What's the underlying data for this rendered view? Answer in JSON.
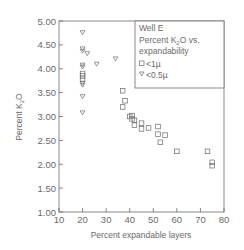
{
  "chart_data": {
    "type": "scatter",
    "title": "Well E",
    "subtitle": "Percent K2O vs. expandability",
    "xlabel": "Percent expandable layers",
    "ylabel": "Percent K2O",
    "xlim": [
      10,
      80
    ],
    "ylim": [
      1.0,
      5.0
    ],
    "x_ticks": [
      "10",
      "20",
      "30",
      "40",
      "50",
      "60",
      "70",
      "80"
    ],
    "y_ticks": [
      "1.00",
      "1.50",
      "2.00",
      "2.50",
      "3.00",
      "3.50",
      "4.00",
      "4.50",
      "5.00"
    ],
    "grid": false,
    "legend_position": "upper right",
    "series": [
      {
        "name": "<1µ",
        "marker": "square",
        "points": [
          [
            20,
            3.9
          ],
          [
            20,
            3.85
          ],
          [
            20,
            3.78
          ],
          [
            37,
            3.54
          ],
          [
            38,
            3.33
          ],
          [
            37,
            3.2
          ],
          [
            41,
            3.02
          ],
          [
            40,
            3.0
          ],
          [
            41,
            2.95
          ],
          [
            42,
            2.92
          ],
          [
            42,
            2.82
          ],
          [
            45,
            2.86
          ],
          [
            45,
            2.74
          ],
          [
            48,
            2.76
          ],
          [
            52,
            2.79
          ],
          [
            52,
            2.63
          ],
          [
            53,
            2.46
          ],
          [
            55,
            2.61
          ],
          [
            60,
            2.27
          ],
          [
            73,
            2.27
          ],
          [
            75,
            2.04
          ],
          [
            75,
            1.97
          ]
        ]
      },
      {
        "name": "<0.5µ",
        "marker": "triangle-down",
        "points": [
          [
            20,
            4.76
          ],
          [
            20,
            4.42
          ],
          [
            20,
            4.37
          ],
          [
            22,
            4.32
          ],
          [
            20,
            4.08
          ],
          [
            20,
            4.04
          ],
          [
            26,
            4.1
          ],
          [
            34,
            4.21
          ],
          [
            20,
            3.7
          ],
          [
            20,
            3.66
          ],
          [
            20,
            3.42
          ],
          [
            20,
            3.08
          ]
        ]
      }
    ]
  },
  "legend": {
    "title": "Well E",
    "line2_prefix": "Percent K",
    "line2_sub": "2",
    "line2_suffix": "O vs.",
    "line3": "expandability",
    "item1": "<1µ",
    "item2": "<0.5µ"
  },
  "axes": {
    "xlabel": "Percent expandable layers",
    "ylabel_prefix": "Percent K",
    "ylabel_sub": "2",
    "ylabel_suffix": "O"
  },
  "colors": {
    "ink": "#6a6a6a",
    "background": "#ffffff"
  }
}
